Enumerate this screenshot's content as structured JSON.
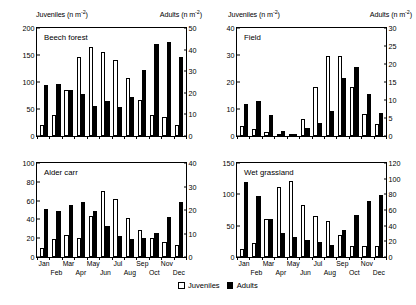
{
  "figure": {
    "juveniles_header": "Juveniles (n m",
    "juveniles_header_sup": "-2",
    "juveniles_header_tail": ")",
    "adults_header": "Adults (n m",
    "adults_header_sup": "-2",
    "adults_header_tail": ")"
  },
  "legend": {
    "juveniles": "Juveniles",
    "adults": "Adults",
    "juveniles_color": "#ffffff",
    "adults_color": "#000000"
  },
  "months": [
    "Jan",
    "Feb",
    "Mar",
    "Apr",
    "May",
    "Jun",
    "Jul",
    "Aug",
    "Sep",
    "Oct",
    "Nov",
    "Dec"
  ],
  "chart_data": [
    {
      "type": "bar",
      "title": "Beech forest",
      "panel": "top-left",
      "xlabel": "",
      "categories": [
        "Jan",
        "Feb",
        "Mar",
        "Apr",
        "May",
        "Jun",
        "Jul",
        "Aug",
        "Sep",
        "Oct",
        "Nov",
        "Dec"
      ],
      "left_axis": {
        "label": "Juveniles (n m-2)",
        "ylim": [
          0,
          200
        ],
        "ticks": [
          0,
          50,
          100,
          150,
          200
        ]
      },
      "right_axis": {
        "label": "Adults (n m-2)",
        "ylim": [
          0,
          50
        ],
        "ticks": [
          0,
          10,
          20,
          30,
          40,
          50
        ]
      },
      "grid": false,
      "legend_position": "bottom-center",
      "series": [
        {
          "name": "Juveniles",
          "axis": "left",
          "values": [
            21,
            38,
            86,
            146,
            165,
            156,
            140,
            108,
            66,
            39,
            36,
            20
          ]
        },
        {
          "name": "Adults",
          "axis": "right",
          "values": [
            23.5,
            24,
            21.5,
            19.5,
            14,
            16,
            13.5,
            18,
            30.5,
            42.5,
            43.5,
            36.5
          ]
        }
      ]
    },
    {
      "type": "bar",
      "title": "Field",
      "panel": "top-right",
      "xlabel": "",
      "categories": [
        "Jan",
        "Feb",
        "Mar",
        "Apr",
        "May",
        "Jun",
        "Jul",
        "Aug",
        "Sep",
        "Oct",
        "Nov",
        "Dec"
      ],
      "left_axis": {
        "label": "Juveniles (n m-2)",
        "ylim": [
          0,
          40
        ],
        "ticks": [
          0,
          10,
          20,
          30,
          40
        ]
      },
      "right_axis": {
        "label": "Adults (n m-2)",
        "ylim": [
          0,
          30
        ],
        "ticks": [
          0,
          5,
          10,
          15,
          20,
          25,
          30
        ]
      },
      "grid": false,
      "legend_position": "bottom-center",
      "series": [
        {
          "name": "Juveniles",
          "axis": "left",
          "values": [
            3.8,
            2.6,
            1.4,
            0.4,
            0.8,
            6.2,
            18.2,
            29.6,
            29.8,
            18.2,
            8.2,
            4.4
          ]
        },
        {
          "name": "Adults",
          "axis": "right",
          "values": [
            9,
            9.6,
            5.8,
            1.5,
            0.6,
            2.3,
            3.6,
            6.9,
            16,
            19.3,
            11.6,
            6.4
          ]
        }
      ]
    },
    {
      "type": "bar",
      "title": "Alder carr",
      "panel": "bottom-left",
      "xlabel": "",
      "categories": [
        "Jan",
        "Feb",
        "Mar",
        "Apr",
        "May",
        "Jun",
        "Jul",
        "Aug",
        "Sep",
        "Oct",
        "Nov",
        "Dec"
      ],
      "left_axis": {
        "label": "Juveniles (n m-2)",
        "ylim": [
          0,
          100
        ],
        "ticks": [
          0,
          20,
          40,
          60,
          80,
          100
        ]
      },
      "right_axis": {
        "label": "Adults (n m-2)",
        "ylim": [
          0,
          40
        ],
        "ticks": [
          0,
          10,
          20,
          30,
          40
        ]
      },
      "grid": false,
      "legend_position": "bottom-center",
      "series": [
        {
          "name": "Juveniles",
          "axis": "left",
          "values": [
            10,
            19,
            23.5,
            20.5,
            43.5,
            70,
            62,
            41,
            29,
            20,
            16,
            13
          ]
        },
        {
          "name": "Adults",
          "axis": "right",
          "values": [
            20.4,
            19.4,
            22.2,
            23.2,
            19.4,
            13.4,
            8.8,
            7.6,
            8,
            10.4,
            17,
            23.2
          ]
        }
      ]
    },
    {
      "type": "bar",
      "title": "Wet grassland",
      "panel": "bottom-right",
      "xlabel": "",
      "categories": [
        "Jan",
        "Feb",
        "Mar",
        "Apr",
        "May",
        "Jun",
        "Jul",
        "Aug",
        "Sep",
        "Oct",
        "Nov",
        "Dec"
      ],
      "left_axis": {
        "label": "Juveniles (n m-2)",
        "ylim": [
          0,
          150
        ],
        "ticks": [
          0,
          50,
          100,
          150
        ]
      },
      "right_axis": {
        "label": "Adults (n m-2)",
        "ylim": [
          0,
          120
        ],
        "ticks": [
          0,
          20,
          40,
          60,
          80,
          100,
          120
        ]
      },
      "grid": false,
      "legend_position": "bottom-center",
      "series": [
        {
          "name": "Juveniles",
          "axis": "left",
          "values": [
            13,
            22,
            61,
            112,
            122,
            83,
            66,
            57,
            35,
            18,
            18,
            17
          ]
        },
        {
          "name": "Adults",
          "axis": "right",
          "values": [
            96,
            78,
            48,
            31,
            26,
            22,
            19,
            15,
            35,
            53,
            71,
            79
          ]
        }
      ]
    }
  ]
}
